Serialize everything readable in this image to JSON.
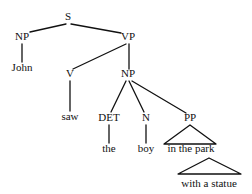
{
  "diagram": {
    "type": "syntax-parse-tree",
    "sentence": "John saw the boy in the park with a statue",
    "background_color": "#ffffff",
    "line_color": "#111111",
    "text_color": "#111111"
  },
  "nodes": {
    "s": {
      "label": "S",
      "x": 68,
      "y": 20
    },
    "np_subject": {
      "label": "NP",
      "x": 22,
      "y": 40
    },
    "vp": {
      "label": "VP",
      "x": 128,
      "y": 40
    },
    "john": {
      "label": "John",
      "x": 22,
      "y": 71
    },
    "v": {
      "label": "V",
      "x": 70,
      "y": 77
    },
    "np_object": {
      "label": "NP",
      "x": 128,
      "y": 77
    },
    "saw": {
      "label": "saw",
      "x": 70,
      "y": 120
    },
    "det": {
      "label": "DET",
      "x": 109,
      "y": 121
    },
    "n": {
      "label": "N",
      "x": 146,
      "y": 121
    },
    "pp_park": {
      "label": "PP",
      "x": 190,
      "y": 121
    },
    "the": {
      "label": "the",
      "x": 109,
      "y": 152
    },
    "boy": {
      "label": "boy",
      "x": 146,
      "y": 152
    },
    "in_the_park": {
      "label": "in the park",
      "x": 191,
      "y": 152
    },
    "with_a_statue": {
      "label": "with a statue",
      "x": 209,
      "y": 187
    }
  },
  "edges": [
    {
      "name": "s-to-np-subject",
      "x1": 66,
      "y1": 24,
      "x2": 30,
      "y2": 32
    },
    {
      "name": "s-to-vp",
      "x1": 71,
      "y1": 24,
      "x2": 121,
      "y2": 33
    },
    {
      "name": "np-subject-to-john",
      "x1": 22,
      "y1": 44,
      "x2": 22,
      "y2": 62
    },
    {
      "name": "vp-to-v",
      "x1": 126,
      "y1": 44,
      "x2": 73,
      "y2": 69
    },
    {
      "name": "vp-to-np-object",
      "x1": 129,
      "y1": 44,
      "x2": 129,
      "y2": 69
    },
    {
      "name": "v-to-saw",
      "x1": 70,
      "y1": 81,
      "x2": 70,
      "y2": 111
    },
    {
      "name": "np-object-to-det",
      "x1": 126,
      "y1": 81,
      "x2": 111,
      "y2": 112
    },
    {
      "name": "np-object-to-n",
      "x1": 129,
      "y1": 81,
      "x2": 144,
      "y2": 112
    },
    {
      "name": "np-object-to-pp",
      "x1": 132,
      "y1": 81,
      "x2": 186,
      "y2": 113
    },
    {
      "name": "det-to-the",
      "x1": 109,
      "y1": 125,
      "x2": 109,
      "y2": 143
    },
    {
      "name": "n-to-boy",
      "x1": 146,
      "y1": 125,
      "x2": 146,
      "y2": 143
    }
  ],
  "triangles": [
    {
      "name": "pp-park-triangle",
      "apex_x": 190,
      "apex_y": 125,
      "left_x": 164,
      "left_y": 144,
      "right_x": 216,
      "right_y": 144
    },
    {
      "name": "pp-statue-triangle",
      "apex_x": 209,
      "apex_y": 158,
      "left_x": 178,
      "left_y": 174,
      "right_x": 241,
      "right_y": 174
    }
  ]
}
